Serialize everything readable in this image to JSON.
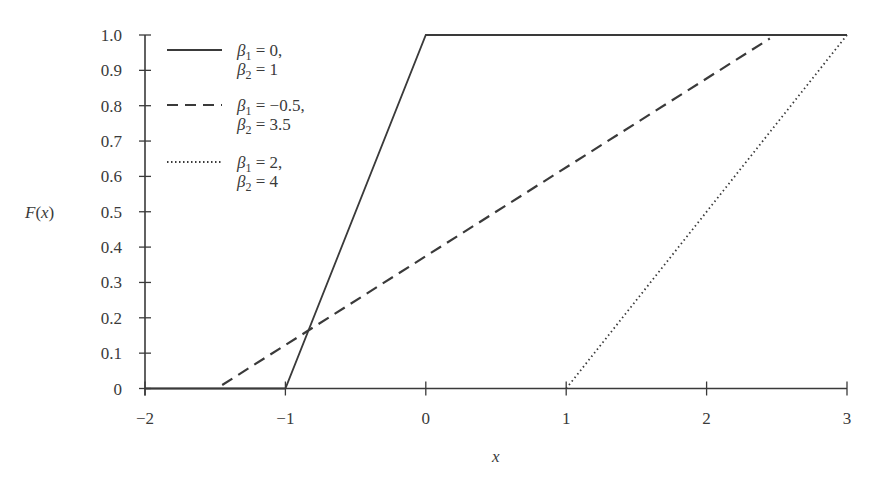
{
  "chart_data": {
    "type": "line",
    "title": "",
    "xlabel": "x",
    "ylabel": "F(x)",
    "xlim": [
      -2,
      3
    ],
    "ylim": [
      0,
      1.0
    ],
    "grid": false,
    "legend_position": "upper-left",
    "x_ticks": [
      "−2",
      "−1",
      "0",
      "1",
      "2",
      "3"
    ],
    "x_tick_values": [
      -2,
      -1,
      0,
      1,
      2,
      3
    ],
    "y_ticks": [
      "0",
      "0.1",
      "0.2",
      "0.3",
      "0.4",
      "0.5",
      "0.6",
      "0.7",
      "0.8",
      "0.9",
      "1.0"
    ],
    "y_tick_values": [
      0,
      0.1,
      0.2,
      0.3,
      0.4,
      0.5,
      0.6,
      0.7,
      0.8,
      0.9,
      1.0
    ],
    "series": [
      {
        "name": "β1 = 0, β2 = 1",
        "legend_line1": {
          "sym": "β",
          "sub": "1",
          "rest": " = 0,"
        },
        "legend_line2": {
          "sym": "β",
          "sub": "2",
          "rest": " = 1"
        },
        "style": "solid",
        "x": [
          -2,
          -1,
          0,
          3
        ],
        "y": [
          0,
          0,
          1.0,
          1.0
        ]
      },
      {
        "name": "β1 = −0.5, β2 = 3.5",
        "legend_line1": {
          "sym": "β",
          "sub": "1",
          "rest": " = −0.5,"
        },
        "legend_line2": {
          "sym": "β",
          "sub": "2",
          "rest": " = 3.5"
        },
        "style": "dashed",
        "x": [
          -1.45,
          2.45
        ],
        "y": [
          0.01,
          0.99
        ]
      },
      {
        "name": "β1 = 2, β2 = 4",
        "legend_line1": {
          "sym": "β",
          "sub": "1",
          "rest": " = 2,"
        },
        "legend_line2": {
          "sym": "β",
          "sub": "2",
          "rest": " = 4"
        },
        "style": "dotted",
        "x": [
          1.0,
          3.0
        ],
        "y": [
          0.0,
          1.0
        ]
      }
    ],
    "colors": {
      "line": "#3a3a3a",
      "axis": "#3a3a3a",
      "background": "#ffffff"
    }
  }
}
